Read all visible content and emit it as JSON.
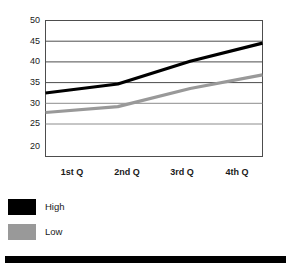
{
  "chart_data": {
    "type": "line",
    "title": "",
    "subtitle": "",
    "xlabel": "",
    "ylabel": "",
    "categories": [
      "1st Q",
      "2nd Q",
      "3rd Q",
      "4th Q"
    ],
    "yticks": [
      20,
      25,
      30,
      35,
      40,
      45,
      50
    ],
    "ylim": [
      20,
      50
    ],
    "grid": true,
    "legend_position": "below-left",
    "series": [
      {
        "name": "High",
        "color": "#000000",
        "values": [
          34,
          36,
          41,
          45
        ]
      },
      {
        "name": "Low",
        "color": "#999999",
        "values": [
          29.7,
          31,
          35,
          38
        ]
      }
    ]
  },
  "axis": {
    "y_tick_labels": [
      "50",
      "45",
      "40",
      "35",
      "30",
      "25",
      "20"
    ],
    "x_tick_labels": [
      "1st Q",
      "2nd Q",
      "3rd Q",
      "4th Q"
    ]
  },
  "legend": {
    "items": [
      {
        "label": "High",
        "color": "#000000"
      },
      {
        "label": "Low",
        "color": "#999999"
      }
    ]
  },
  "colors": {
    "plot_border": "#4d4d4d",
    "gridline": "#666666",
    "high_series": "#000000",
    "low_series": "#999999",
    "background": "#ffffff",
    "footer_bar": "#000000"
  }
}
